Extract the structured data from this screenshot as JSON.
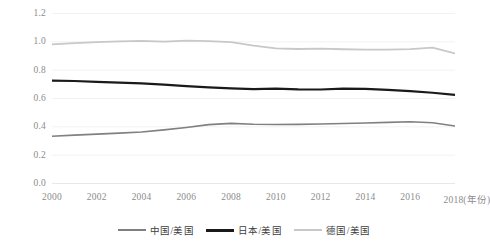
{
  "chart_data": {
    "type": "line",
    "title": "",
    "xlabel": "年份",
    "ylabel": "",
    "ylim": [
      0.0,
      1.2
    ],
    "xlim": [
      2000,
      2018
    ],
    "grid": true,
    "legend_position": "bottom",
    "x": [
      2000,
      2001,
      2002,
      2003,
      2004,
      2005,
      2006,
      2007,
      2008,
      2009,
      2010,
      2011,
      2012,
      2013,
      2014,
      2015,
      2016,
      2017,
      2018
    ],
    "ytick_labels": [
      "0.0",
      "0.2",
      "0.4",
      "0.6",
      "0.8",
      "1.0",
      "1.2"
    ],
    "ytick_values": [
      0.0,
      0.2,
      0.4,
      0.6,
      0.8,
      1.0,
      1.2
    ],
    "xtick_labels": [
      "2000",
      "2002",
      "2004",
      "2006",
      "2008",
      "2010",
      "2012",
      "2014",
      "2016",
      "2018(年份)"
    ],
    "xtick_values": [
      2000,
      2002,
      2004,
      2006,
      2008,
      2010,
      2012,
      2014,
      2016,
      2018
    ],
    "series": [
      {
        "name": "中国/美国",
        "color": "#808080",
        "width": 1.6,
        "values": [
          0.33,
          0.338,
          0.345,
          0.352,
          0.36,
          0.375,
          0.392,
          0.412,
          0.421,
          0.415,
          0.413,
          0.414,
          0.416,
          0.42,
          0.424,
          0.428,
          0.432,
          0.425,
          0.402
        ]
      },
      {
        "name": "日本/美国",
        "color": "#1a1a1a",
        "width": 2.2,
        "values": [
          0.722,
          0.72,
          0.714,
          0.709,
          0.703,
          0.694,
          0.684,
          0.675,
          0.668,
          0.663,
          0.666,
          0.661,
          0.66,
          0.666,
          0.664,
          0.658,
          0.648,
          0.637,
          0.622
        ]
      },
      {
        "name": "德国/美国",
        "color": "#c8c8c8",
        "width": 1.8,
        "values": [
          0.978,
          0.988,
          0.995,
          1.0,
          1.003,
          0.998,
          1.005,
          1.002,
          0.995,
          0.97,
          0.95,
          0.946,
          0.949,
          0.944,
          0.942,
          0.941,
          0.945,
          0.955,
          0.915
        ]
      }
    ]
  },
  "legend": {
    "items": [
      {
        "label": "中国/美国",
        "color": "#808080",
        "swatch_height": 2
      },
      {
        "label": "日本/美国",
        "color": "#1a1a1a",
        "swatch_height": 3
      },
      {
        "label": "德国/美国",
        "color": "#c8c8c8",
        "swatch_height": 2
      }
    ]
  },
  "axes": {
    "tick_color": "#8c8c8c",
    "grid_color": "#f2f2f2",
    "baseline_color": "#e8e8e8"
  }
}
